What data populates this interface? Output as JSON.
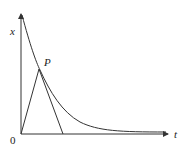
{
  "diagram": {
    "title": "",
    "axes": {
      "vertical_label": "x",
      "horizontal_label": "t",
      "origin_label": "0"
    },
    "point_label": "P",
    "elements": [
      {
        "type": "curve",
        "description": "decreasing exponential-like curve x(t) approaching t-axis"
      },
      {
        "type": "segment",
        "description": "line from origin O to point P"
      },
      {
        "type": "tangent",
        "description": "tangent line at P intersecting t-axis"
      }
    ],
    "colors": {
      "stroke": "#333333",
      "background": "#ffffff"
    }
  }
}
